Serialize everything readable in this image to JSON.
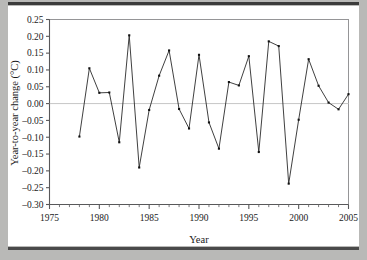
{
  "figure": {
    "background_color": "#b9b9b7",
    "plot_background_color": "#ffffff",
    "rule_color": "#3b3b3b"
  },
  "chart_data": {
    "type": "line",
    "title": "",
    "subtitle": "",
    "xlabel": "Year",
    "ylabel": "Year-to-year change (°C)",
    "xlim": [
      1975,
      2005
    ],
    "ylim": [
      -0.3,
      0.25
    ],
    "xticks": [
      1975,
      1980,
      1985,
      1990,
      1995,
      2000,
      2005
    ],
    "xtick_labels": [
      "1975",
      "1980",
      "1985",
      "1990",
      "1995",
      "2000",
      "2005"
    ],
    "x_minor_tick_step": 1,
    "yticks": [
      0.25,
      0.2,
      0.15,
      0.1,
      0.05,
      0.0,
      -0.05,
      -0.1,
      -0.15,
      -0.2,
      -0.25,
      -0.3
    ],
    "ytick_labels": [
      "0.25",
      "0.20",
      "0.15",
      "0.10",
      "0.05",
      "0.00",
      "–0.05",
      "–0.10",
      "–0.15",
      "–0.20",
      "–0.25",
      "–0.30"
    ],
    "grid": false,
    "zero_reference_line": 0.0,
    "legend": null,
    "marker": "filled-square",
    "line_color": "#2a2a2a",
    "marker_color": "#111111",
    "x": [
      1978,
      1979,
      1980,
      1981,
      1982,
      1983,
      1984,
      1985,
      1986,
      1987,
      1988,
      1989,
      1990,
      1991,
      1992,
      1993,
      1994,
      1995,
      1996,
      1997,
      1998,
      1999,
      2000,
      2001,
      2002,
      2003,
      2004,
      2005
    ],
    "values": [
      -0.098,
      0.105,
      0.032,
      0.033,
      -0.115,
      0.203,
      -0.19,
      -0.019,
      0.083,
      0.158,
      -0.016,
      -0.074,
      0.145,
      -0.056,
      -0.134,
      0.064,
      0.054,
      0.141,
      -0.144,
      0.185,
      0.171,
      -0.238,
      -0.048,
      0.132,
      0.053,
      0.003,
      -0.017,
      0.028
    ],
    "series": [
      {
        "name": "Year-to-year change",
        "values": [
          -0.098,
          0.105,
          0.032,
          0.033,
          -0.115,
          0.203,
          -0.19,
          -0.019,
          0.083,
          0.158,
          -0.016,
          -0.074,
          0.145,
          -0.056,
          -0.134,
          0.064,
          0.054,
          0.141,
          -0.144,
          0.185,
          0.171,
          -0.238,
          -0.048,
          0.132,
          0.053,
          0.003,
          -0.017,
          0.028
        ]
      }
    ]
  }
}
